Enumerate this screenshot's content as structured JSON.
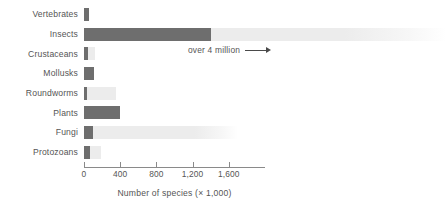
{
  "chart_data": {
    "type": "bar",
    "orientation": "horizontal",
    "title": "",
    "xlabel": "Number of species (× 1,000)",
    "ylabel": "",
    "xlim": [
      0,
      1800
    ],
    "xticks": [
      0,
      400,
      800,
      1200,
      1600
    ],
    "xtick_labels": [
      "0",
      "400",
      "800",
      "1,200",
      "1,600"
    ],
    "grid": false,
    "legend": false,
    "categories": [
      "Vertebrates",
      "Insects",
      "Crustaceans",
      "Mollusks",
      "Roundworms",
      "Plants",
      "Fungi",
      "Protozoans"
    ],
    "values": [
      52,
      1400,
      40,
      110,
      20,
      400,
      100,
      70
    ],
    "estimated_totals": [
      52,
      4000,
      120,
      110,
      350,
      400,
      1700,
      190
    ],
    "series": [
      {
        "name": "Described species (× 1,000)",
        "color": "#6e6e6e",
        "values": [
          52,
          1400,
          40,
          110,
          20,
          400,
          100,
          70
        ]
      },
      {
        "name": "Estimated total species (× 1,000)",
        "color": "#ececec",
        "values": [
          52,
          4000,
          120,
          110,
          350,
          400,
          1700,
          190
        ]
      }
    ],
    "annotations": [
      {
        "text": "over 4 million",
        "target_category": "Insects",
        "arrow": "right"
      }
    ]
  },
  "colors": {
    "bar_dark": "#6e6e6e",
    "bar_light": "#ececec",
    "axis": "#8a8a8a",
    "text": "#555555",
    "background": "#ffffff"
  }
}
